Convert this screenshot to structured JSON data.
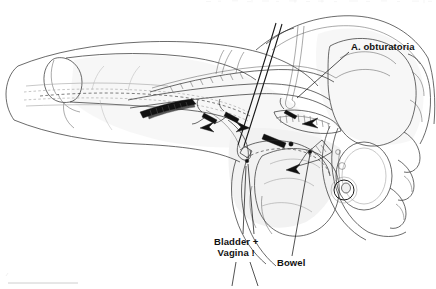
{
  "figure": {
    "kind": "anatomical-line-drawing",
    "background_color": "#ffffff",
    "ink_color": "#1a1a1a",
    "width": 436,
    "height": 289
  },
  "labels": {
    "obturatoria": "A. obturatoria",
    "bladder_line1": "Bladder +",
    "bladder_line2": "Vagina !",
    "bowel": "Bowel"
  },
  "annotations": [
    {
      "name": "a-obturatoria",
      "text": "A. obturatoria",
      "x": 351,
      "y": 41,
      "leader_from": [
        349,
        52
      ],
      "leader_to": [
        297,
        98
      ]
    },
    {
      "name": "bladder-vagina",
      "text": "Bladder + Vagina !",
      "x": 214,
      "y": 236,
      "leader_from": [
        247,
        232
      ],
      "leader_to": [
        240,
        160
      ]
    },
    {
      "name": "bowel",
      "text": "Bowel",
      "x": 277,
      "y": 257,
      "leader_from": [
        292,
        255
      ],
      "leader_to": [
        310,
        152
      ]
    }
  ],
  "structures": [
    {
      "name": "thigh-outline",
      "description": "left thigh soft tissue contour"
    },
    {
      "name": "femur-bone",
      "description": "femoral shaft and condyle outline"
    },
    {
      "name": "femoral-vessels",
      "description": "dashed femoral artery and vein course"
    },
    {
      "name": "vascular-graft",
      "description": "tunnelled obturator bypass graft"
    },
    {
      "name": "vessel-clamps",
      "description": "dark vascular clamps on vessels"
    },
    {
      "name": "retractor",
      "description": "long diagonal surgical retractor"
    },
    {
      "name": "pelvis-bone",
      "description": "ilium, sacrum and pubic rami"
    },
    {
      "name": "obturator-foramen",
      "description": "dark obturator foramen with vessel"
    },
    {
      "name": "bladder-vagina",
      "description": "bladder and vagina outline in pelvis"
    },
    {
      "name": "bowel",
      "description": "bowel loop retracted with arrow"
    },
    {
      "name": "abdominal-wall",
      "description": "lower abdominal wall contour"
    },
    {
      "name": "direction-arrows",
      "description": "solid black directional arrows"
    }
  ]
}
